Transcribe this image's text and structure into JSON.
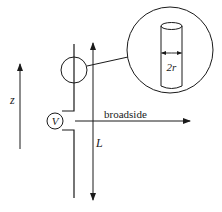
{
  "diagram": {
    "labels": {
      "z_axis": "z",
      "source": "V",
      "length": "L",
      "direction": "broadside",
      "radius": "2r"
    },
    "colors": {
      "stroke": "#1a1a1a",
      "background": "#ffffff"
    },
    "components": [
      {
        "id": "antenna-wire",
        "type": "conductor"
      },
      {
        "id": "voltage-source",
        "label": "V"
      },
      {
        "id": "magnified-detail",
        "description": "cylindrical wire of diameter 2r"
      },
      {
        "id": "length-arrow",
        "label": "L"
      },
      {
        "id": "z-axis-arrow",
        "label": "z"
      },
      {
        "id": "broadside-arrow",
        "label": "broadside"
      }
    ]
  }
}
